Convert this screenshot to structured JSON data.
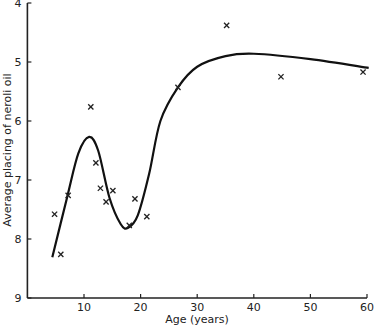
{
  "chart_data": {
    "type": "scatter",
    "title": "",
    "xlabel": "Age (years)",
    "ylabel": "Average placing of neroli oil",
    "xlim": [
      0,
      60
    ],
    "ylim": [
      9,
      4
    ],
    "y_inverted": true,
    "grid": false,
    "legend": null,
    "x_ticks": [
      "10",
      "20",
      "30",
      "40",
      "50",
      "60"
    ],
    "y_ticks": [
      "4",
      "5",
      "6",
      "7",
      "8",
      "9"
    ],
    "series": [
      {
        "name": "observations",
        "marker": "x",
        "points": [
          {
            "x": 4.8,
            "y": 7.58
          },
          {
            "x": 5.9,
            "y": 8.26
          },
          {
            "x": 7.2,
            "y": 7.26
          },
          {
            "x": 11.2,
            "y": 5.76
          },
          {
            "x": 12.1,
            "y": 6.71
          },
          {
            "x": 12.9,
            "y": 7.14
          },
          {
            "x": 13.9,
            "y": 7.37
          },
          {
            "x": 15.1,
            "y": 7.18
          },
          {
            "x": 18.0,
            "y": 7.77
          },
          {
            "x": 19.0,
            "y": 7.32
          },
          {
            "x": 21.1,
            "y": 7.62
          },
          {
            "x": 26.6,
            "y": 5.43
          },
          {
            "x": 35.2,
            "y": 4.38
          },
          {
            "x": 44.8,
            "y": 5.25
          },
          {
            "x": 59.3,
            "y": 5.17
          }
        ]
      },
      {
        "name": "fitted curve",
        "line": "smooth",
        "points": [
          {
            "x": 4.4,
            "y": 8.31
          },
          {
            "x": 7.0,
            "y": 7.3
          },
          {
            "x": 9.0,
            "y": 6.55
          },
          {
            "x": 10.9,
            "y": 6.27
          },
          {
            "x": 12.5,
            "y": 6.5
          },
          {
            "x": 14.5,
            "y": 7.3
          },
          {
            "x": 16.5,
            "y": 7.75
          },
          {
            "x": 17.8,
            "y": 7.81
          },
          {
            "x": 19.5,
            "y": 7.6
          },
          {
            "x": 21.5,
            "y": 6.9
          },
          {
            "x": 23.5,
            "y": 6.0
          },
          {
            "x": 26.6,
            "y": 5.43
          },
          {
            "x": 30.0,
            "y": 5.08
          },
          {
            "x": 35.0,
            "y": 4.9
          },
          {
            "x": 40.0,
            "y": 4.86
          },
          {
            "x": 50.0,
            "y": 4.95
          },
          {
            "x": 60.3,
            "y": 5.1
          }
        ]
      }
    ]
  }
}
